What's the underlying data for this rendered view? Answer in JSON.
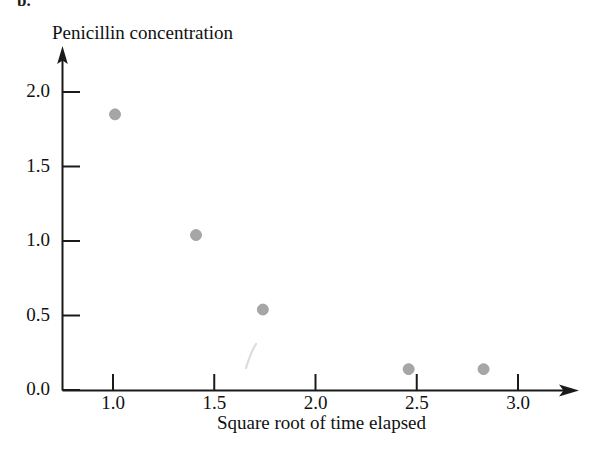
{
  "figure": {
    "panel_label": "b.",
    "background_color": "#ffffff",
    "width": 599,
    "height": 449
  },
  "chart_data": {
    "type": "scatter",
    "title": "",
    "ylabel": "Penicillin concentration",
    "xlabel": "Square root of time elapsed",
    "xlim": [
      0.72,
      3.28
    ],
    "ylim": [
      -0.12,
      2.22
    ],
    "grid": false,
    "legend": null,
    "marker": {
      "shape": "circle",
      "color": "#a6a6a6",
      "edge_color": "#9a9a9a",
      "size_px": 11
    },
    "axis_style": {
      "color": "#1a1a1a",
      "arrow_heads": [
        "x-right",
        "y-up"
      ],
      "tick_direction": "in"
    },
    "xticks": [
      1.0,
      1.5,
      2.0,
      2.5,
      3.0
    ],
    "xtick_labels": [
      "1.0",
      "1.5",
      "2.0",
      "2.5",
      "3.0"
    ],
    "yticks": [
      0.0,
      0.5,
      1.0,
      1.5,
      2.0
    ],
    "ytick_labels": [
      "0.0",
      "0.5",
      "1.0",
      "1.5",
      "2.0"
    ],
    "x": [
      1.01,
      1.41,
      1.74,
      2.46,
      2.83
    ],
    "y": [
      1.85,
      1.04,
      0.54,
      0.14,
      0.14
    ],
    "points": [
      {
        "x": 1.01,
        "y": 1.85
      },
      {
        "x": 1.41,
        "y": 1.04
      },
      {
        "x": 1.74,
        "y": 0.54
      },
      {
        "x": 2.46,
        "y": 0.14
      },
      {
        "x": 2.83,
        "y": 0.14
      }
    ],
    "annotations": []
  }
}
